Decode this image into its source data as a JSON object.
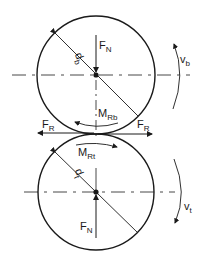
{
  "diagram": {
    "stroke_color": "#1a1a1a",
    "background": "#ffffff",
    "top_roller": {
      "diameter_label": "d",
      "diameter_sub": "b",
      "normal_force": {
        "main": "F",
        "sub": "N"
      },
      "moment": {
        "main": "M",
        "sub": "Rb"
      },
      "velocity": {
        "main": "v",
        "sub": "b"
      }
    },
    "bottom_roller": {
      "diameter_label": "d",
      "diameter_sub": "t",
      "normal_force": {
        "main": "F",
        "sub": "N"
      },
      "moment": {
        "main": "M",
        "sub": "Rt"
      },
      "velocity": {
        "main": "v",
        "sub": "t"
      }
    },
    "friction_left": {
      "main": "F",
      "sub": "R"
    },
    "friction_right": {
      "main": "F",
      "sub": "R"
    }
  }
}
